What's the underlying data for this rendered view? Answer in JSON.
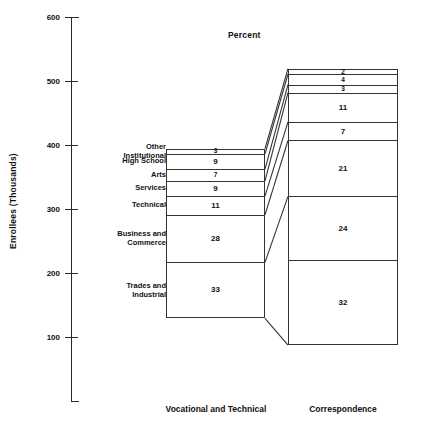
{
  "chart": {
    "title": "Percent",
    "ylabel": "Enrollees (Thousands)"
  },
  "yaxis": {
    "ticks": [
      {
        "label": "600",
        "value": 600
      },
      {
        "label": "500",
        "value": 500
      },
      {
        "label": "400",
        "value": 400
      },
      {
        "label": "300",
        "value": 300
      },
      {
        "label": "200",
        "value": 200
      },
      {
        "label": "100",
        "value": 100
      }
    ]
  },
  "groups": {
    "left_label": "Vocational and Technical",
    "right_label": "Correspondence"
  },
  "categories": [
    "Other Institutional",
    "High School",
    "Arts",
    "Services",
    "Technical",
    "Business and Commerce",
    "Trades and Industrial"
  ],
  "category_lines": [
    [
      "Other",
      "Institutional"
    ],
    [
      "High School"
    ],
    [
      "Arts"
    ],
    [
      "Services"
    ],
    [
      "Technical"
    ],
    [
      "Business and",
      "Commerce"
    ],
    [
      "Trades and",
      "Industrial"
    ]
  ],
  "left_bar": {
    "name": "Vocational and Technical",
    "segments": [
      {
        "label": "Other Institutional",
        "value": "3"
      },
      {
        "label": "High School",
        "value": "9"
      },
      {
        "label": "Arts",
        "value": "7"
      },
      {
        "label": "Services",
        "value": "9"
      },
      {
        "label": "Technical",
        "value": "11"
      },
      {
        "label": "Business and Commerce",
        "value": "28"
      },
      {
        "label": "Trades and Industrial",
        "value": "33"
      }
    ]
  },
  "right_bar": {
    "name": "Correspondence",
    "segments": [
      {
        "label": "Other Institutional",
        "value": "2"
      },
      {
        "label": "High School",
        "value": "4"
      },
      {
        "label": "Arts",
        "value": "3"
      },
      {
        "label": "Services",
        "value": "11"
      },
      {
        "label": "Technical",
        "value": "7"
      },
      {
        "label": "Business and Commerce",
        "value": "21"
      },
      {
        "label": "Trades and Industrial",
        "value": "24"
      },
      {
        "label": "Trades and Industrial (lower)",
        "value": "32"
      }
    ]
  },
  "chart_data": {
    "type": "bar",
    "subtype": "stacked-bar-paired-with-connectors",
    "title": "Percent",
    "xlabel": "",
    "ylabel": "Enrollees (Thousands)",
    "ylim": [
      0,
      600
    ],
    "yticks": [
      100,
      200,
      300,
      400,
      500,
      600
    ],
    "grid": false,
    "legend": "none",
    "categories": [
      "Trades and Industrial",
      "Business and Commerce",
      "Technical",
      "Services",
      "Arts",
      "High School",
      "Other Institutional"
    ],
    "series": [
      {
        "name": "Vocational and Technical",
        "unit": "percent",
        "values": [
          33,
          28,
          11,
          9,
          7,
          9,
          3
        ],
        "total_percent": 100,
        "bar_bottom_thousands": 130,
        "bar_top_thousands": 395
      },
      {
        "name": "Correspondence",
        "unit": "percent",
        "values": [
          32,
          24,
          21,
          11,
          3,
          4,
          2
        ],
        "total_percent": 100,
        "bar_bottom_thousands": 88,
        "bar_top_thousands": 520
      }
    ],
    "annotations": [
      "Segment boundaries of the two bars are joined by straight connector lines."
    ]
  }
}
